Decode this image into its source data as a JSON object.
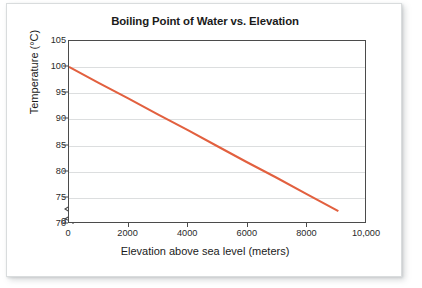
{
  "chart_data": {
    "type": "line",
    "title": "Boiling Point of Water vs. Elevation",
    "xlabel": "Elevation above sea level (meters)",
    "ylabel": "Temperature (°C)",
    "xlim": [
      0,
      10000
    ],
    "ylim": [
      70,
      105
    ],
    "y_axis_broken": true,
    "y_break_label": "0",
    "grid": true,
    "grid_axis": "y",
    "legend": null,
    "xticks": [
      0,
      2000,
      4000,
      6000,
      8000,
      10000
    ],
    "xticklabels": [
      "0",
      "2000",
      "4000",
      "6000",
      "8000",
      "10,000"
    ],
    "yticks": [
      70,
      75,
      80,
      85,
      90,
      95,
      100,
      105
    ],
    "yticklabels": [
      "70",
      "75",
      "80",
      "85",
      "90",
      "95",
      "100",
      "105"
    ],
    "series": [
      {
        "name": "Boiling point",
        "color": "#e2603f",
        "x": [
          0,
          1000,
          2000,
          3000,
          4000,
          5000,
          6000,
          7000,
          8000,
          9100
        ],
        "values": [
          100.0,
          96.9,
          93.9,
          90.8,
          87.8,
          84.7,
          81.6,
          78.6,
          75.5,
          72.1
        ]
      }
    ],
    "annotations": []
  },
  "chart": {
    "title": "Boiling Point of Water vs. Elevation",
    "x_axis_title": "Elevation above sea level (meters)",
    "y_axis_title": "Temperature (°C)",
    "zero_tick": "0",
    "line_color": "#e2603f",
    "grid_color": "#dcdedf",
    "axis_color": "#4b4b4b"
  }
}
